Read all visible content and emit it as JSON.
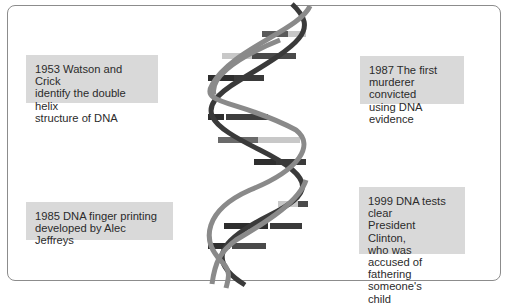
{
  "diagram": {
    "colors": {
      "card_background": "#d9d9d9",
      "strand_light": "#8a8a8a",
      "strand_dark": "#3a3a3a",
      "rung_light": "#c8c8c8",
      "rung_mid": "#6a6a6a",
      "rung_dark": "#2e2e2e",
      "frame_border": "#8c8c8c"
    },
    "events": [
      {
        "year": "1953",
        "text": "1953 Watson and Crick identify the double helix structure of DNA",
        "lines": [
          "1953 Watson and Crick",
          "identify the double helix",
          "structure of DNA"
        ]
      },
      {
        "year": "1987",
        "text": "1987 The first murderer convicted using DNA evidence",
        "lines": [
          "1987 The first",
          "murderer convicted",
          "using DNA evidence"
        ]
      },
      {
        "year": "1985",
        "text": "1985 DNA finger printing developed by Alec Jeffreys",
        "lines": [
          "1985 DNA finger printing",
          "developed by Alec Jeffreys"
        ]
      },
      {
        "year": "1999",
        "text": "1999 DNA tests clear President Clinton, who was accused of fathering someone's child",
        "lines": [
          "1999 DNA tests clear",
          "President Clinton,",
          "who was accused of",
          "fathering someone's",
          "child"
        ]
      }
    ]
  }
}
